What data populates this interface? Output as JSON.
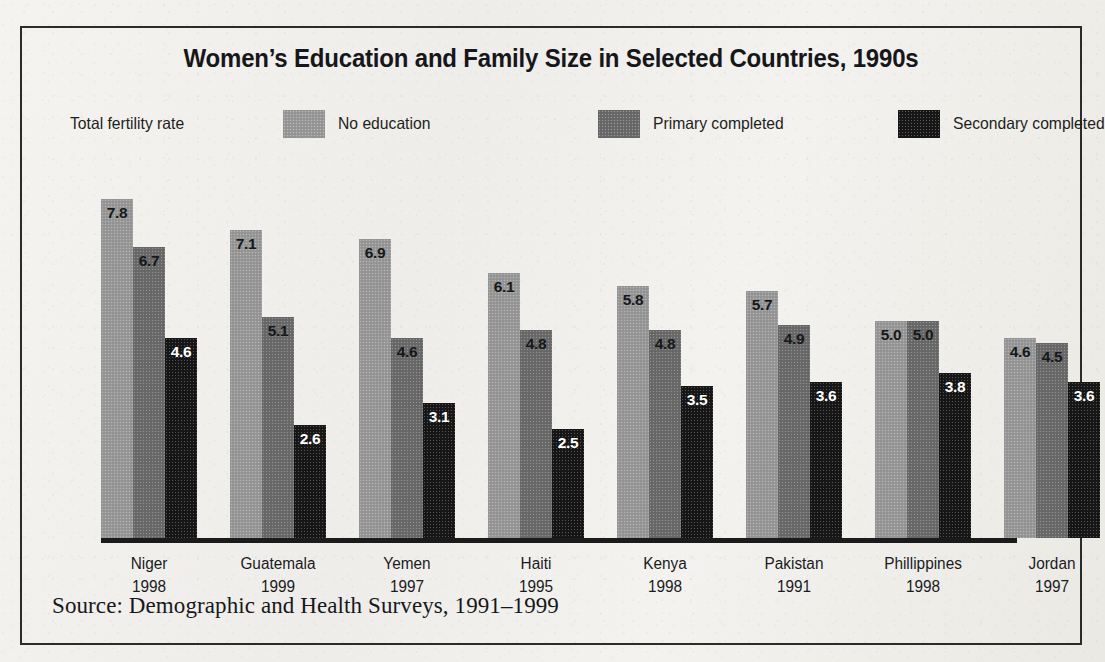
{
  "page": {
    "top_fragment": "",
    "background_color": "#edece8"
  },
  "chart_panel": {
    "title": "Women’s Education and Family Size in Selected Countries, 1990s",
    "axis_label": "Total fertility rate",
    "source": "Source: Demographic and Health Surveys, 1991–1999",
    "frame_color": "#2b2b2b"
  },
  "legend": {
    "items": [
      {
        "label": "No education",
        "color": "#9a9a9a"
      },
      {
        "label": "Primary completed",
        "color": "#6b6b6b"
      },
      {
        "label": "Secondary completed",
        "color": "#171717"
      }
    ]
  },
  "chart_data": {
    "type": "bar",
    "title": "Women’s Education and Family Size in Selected Countries, 1990s",
    "xlabel": "",
    "ylabel": "Total fertility rate",
    "ylim": [
      0,
      8
    ],
    "grid": false,
    "legend_position": "top",
    "categories": [
      "Niger 1998",
      "Guatemala 1999",
      "Yemen 1997",
      "Haiti 1995",
      "Kenya 1998",
      "Pakistan 1991",
      "Phillippines 1998",
      "Jordan 1997"
    ],
    "category_names": [
      "Niger",
      "Guatemala",
      "Yemen",
      "Haiti",
      "Kenya",
      "Pakistan",
      "Phillippines",
      "Jordan"
    ],
    "category_years": [
      "1998",
      "1999",
      "1997",
      "1995",
      "1998",
      "1991",
      "1998",
      "1997"
    ],
    "series": [
      {
        "name": "No education",
        "color": "#9a9a9a",
        "label_color": "#17181a",
        "values": [
          7.8,
          7.1,
          6.9,
          6.1,
          5.8,
          5.7,
          5.0,
          4.6
        ],
        "labels": [
          "7.8",
          "7.1",
          "6.9",
          "6.1",
          "5.8",
          "5.7",
          "5.0",
          "4.6"
        ]
      },
      {
        "name": "Primary completed",
        "color": "#6b6b6b",
        "label_color": "#17181a",
        "values": [
          6.7,
          5.1,
          4.6,
          4.8,
          4.8,
          4.9,
          5.0,
          4.5
        ],
        "labels": [
          "6.7",
          "5.1",
          "4.6",
          "4.8",
          "4.8",
          "4.9",
          "5.0",
          "4.5"
        ]
      },
      {
        "name": "Secondary completed",
        "color": "#171717",
        "label_color": "#ffffff",
        "values": [
          4.6,
          2.6,
          3.1,
          2.5,
          3.5,
          3.6,
          3.8,
          3.6
        ],
        "labels": [
          "4.6",
          "2.6",
          "3.1",
          "2.5",
          "3.5",
          "3.6",
          "3.8",
          "3.6"
        ]
      }
    ]
  }
}
